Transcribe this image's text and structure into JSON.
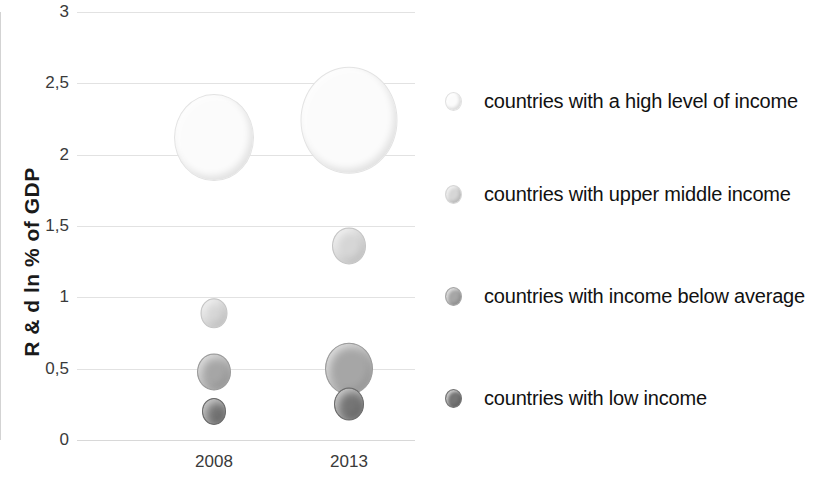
{
  "chart_data": {
    "type": "scatter",
    "title": "",
    "xlabel": "",
    "ylabel": "R & d ln % of GDP",
    "categories": [
      "2008",
      "2013"
    ],
    "x_tick_labels": [
      "2008",
      "2013"
    ],
    "y_tick_labels": [
      "0",
      "0,5",
      "1",
      "1,5",
      "2",
      "2,5",
      "3"
    ],
    "y_tick_values": [
      0,
      0.5,
      1,
      1.5,
      2,
      2.5,
      3
    ],
    "ylim": [
      0,
      3
    ],
    "grid": true,
    "legend_position": "right",
    "series": [
      {
        "name": "countries with a high level of income",
        "color": "#fbfbfb",
        "edge_color": "#e3e3e3",
        "values": [
          2.12,
          2.24
        ],
        "sizes": [
          78,
          95
        ]
      },
      {
        "name": "countries with upper middle income",
        "color": "#d6d6d6",
        "edge_color": "#c4c4c4",
        "values": [
          0.89,
          1.36
        ],
        "sizes": [
          25,
          32
        ]
      },
      {
        "name": "countries with income below average",
        "color": "#a6a6a6",
        "edge_color": "#9a9a9a",
        "values": [
          0.48,
          0.5
        ],
        "sizes": [
          32,
          46
        ]
      },
      {
        "name": "countries with low income",
        "color": "#757575",
        "edge_color": "#6b6b6b",
        "values": [
          0.2,
          0.25
        ],
        "sizes": [
          22,
          28
        ]
      }
    ],
    "points": [
      {
        "series": "countries with a high level of income",
        "x": "2008",
        "y": 2.12,
        "size_px": 78
      },
      {
        "series": "countries with a high level of income",
        "x": "2013",
        "y": 2.24,
        "size_px": 95
      },
      {
        "series": "countries with upper middle income",
        "x": "2008",
        "y": 0.89,
        "size_px": 25
      },
      {
        "series": "countries with upper middle income",
        "x": "2013",
        "y": 1.36,
        "size_px": 32
      },
      {
        "series": "countries with income below average",
        "x": "2008",
        "y": 0.48,
        "size_px": 32
      },
      {
        "series": "countries with income below average",
        "x": "2013",
        "y": 0.5,
        "size_px": 46
      },
      {
        "series": "countries with low income",
        "x": "2008",
        "y": 0.2,
        "size_px": 22
      },
      {
        "series": "countries with low income",
        "x": "2013",
        "y": 0.25,
        "size_px": 28
      }
    ]
  },
  "axis": {
    "y_title": "R & d ln % of GDP",
    "y_ticks": [
      {
        "label": "3",
        "value": 3
      },
      {
        "label": "2,5",
        "value": 2.5
      },
      {
        "label": "2",
        "value": 2
      },
      {
        "label": "1,5",
        "value": 1.5
      },
      {
        "label": "1",
        "value": 1
      },
      {
        "label": "0,5",
        "value": 0.5
      },
      {
        "label": "0",
        "value": 0
      }
    ],
    "x_ticks": [
      {
        "label": "2008"
      },
      {
        "label": "2013"
      }
    ]
  },
  "legend": {
    "items": [
      {
        "label": "countries with a high level of income",
        "color": "#fbfbfb"
      },
      {
        "label": "countries with upper middle income",
        "color": "#d6d6d6"
      },
      {
        "label": "countries with income below average",
        "color": "#a6a6a6"
      },
      {
        "label": "countries with low income",
        "color": "#757575"
      }
    ]
  }
}
